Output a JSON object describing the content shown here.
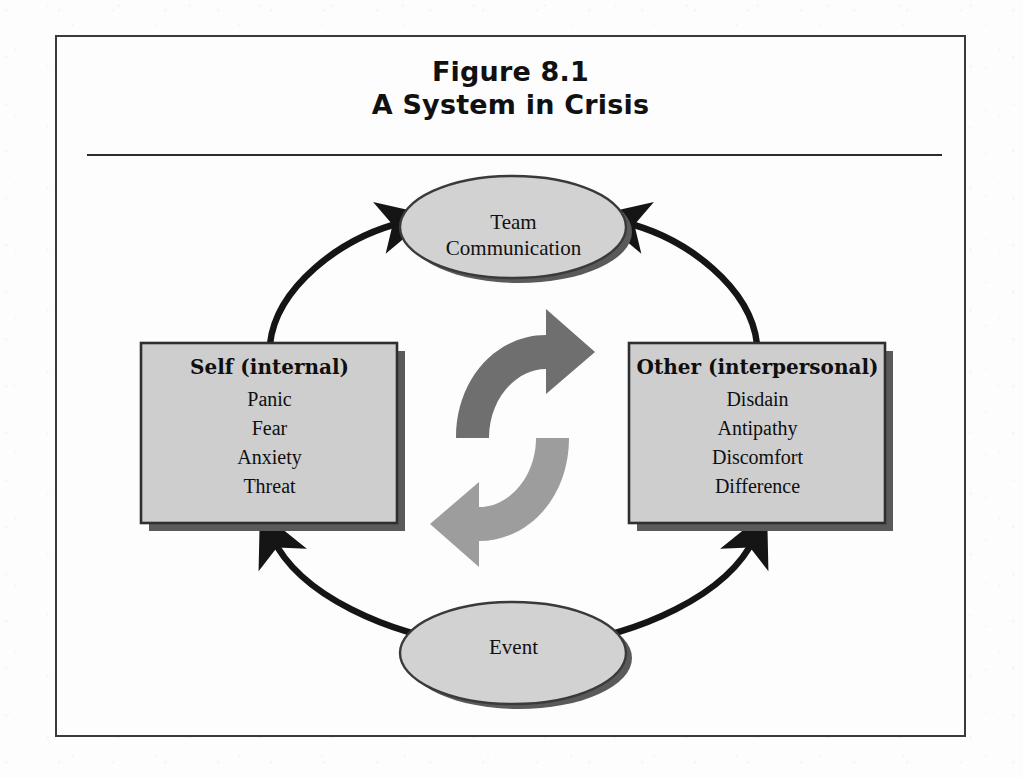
{
  "figure": {
    "title_line1": "Figure 8.1",
    "title_line2": "A System in Crisis",
    "frame_border_color": "#3a3a3a",
    "page_background": "#fdfdfd"
  },
  "diagram": {
    "type": "cycle-diagram",
    "center_symbol": "circular-recycle-arrows",
    "colors": {
      "node_fill": "#d2d2d2",
      "node_stroke": "#3a3a3a",
      "node_shadow": "#5a5a5a",
      "arrow": "#151515",
      "center_arrow_dark": "#6e6e6e",
      "center_arrow_light": "#9a9a9a"
    },
    "nodes": [
      {
        "id": "team-communication",
        "shape": "ellipse",
        "label_line1": "Team",
        "label_line2": "Communication",
        "position": "top"
      },
      {
        "id": "self-internal",
        "shape": "box",
        "heading": "Self (internal)",
        "items": [
          "Panic",
          "Fear",
          "Anxiety",
          "Threat"
        ],
        "position": "left"
      },
      {
        "id": "other-interpersonal",
        "shape": "box",
        "heading": "Other (interpersonal)",
        "items": [
          "Disdain",
          "Antipathy",
          "Discomfort",
          "Difference"
        ],
        "position": "right"
      },
      {
        "id": "event",
        "shape": "ellipse",
        "label_line1": "Event",
        "position": "bottom"
      }
    ],
    "edges": [
      {
        "from": "event",
        "to": "self-internal",
        "direction": "up-left"
      },
      {
        "from": "event",
        "to": "other-interpersonal",
        "direction": "up-right"
      },
      {
        "from": "self-internal",
        "to": "team-communication",
        "direction": "up-right"
      },
      {
        "from": "other-interpersonal",
        "to": "team-communication",
        "direction": "up-left"
      }
    ]
  }
}
